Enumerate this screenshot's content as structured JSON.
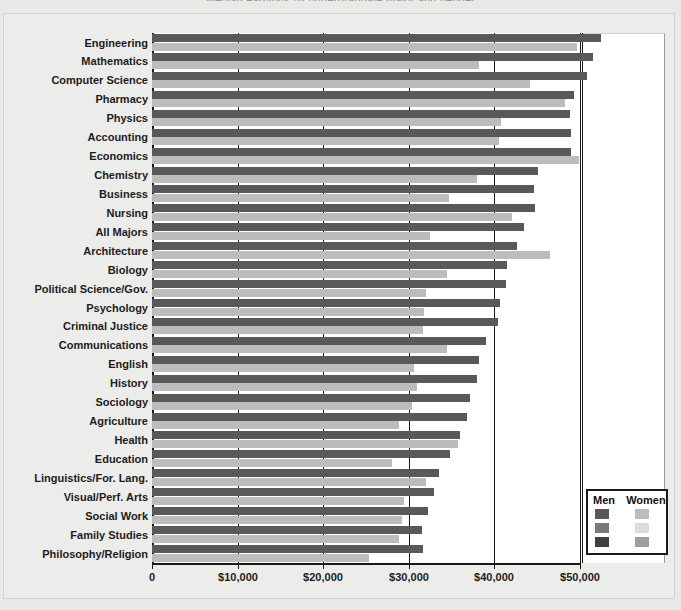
{
  "title": "Median earnings by undergraduate major and gender",
  "axis": {
    "ticks": [
      {
        "label": "0",
        "value": 0
      },
      {
        "label": "$10,000",
        "value": 10000
      },
      {
        "label": "$20,000",
        "value": 20000
      },
      {
        "label": "$30,000",
        "value": 30000
      },
      {
        "label": "$40,000",
        "value": 40000
      },
      {
        "label": "$50,000",
        "value": 50000
      }
    ],
    "min": 0,
    "max": 50000
  },
  "legend": {
    "men_header": "Men",
    "women_header": "Women",
    "swatches": [
      {
        "men": "#595959",
        "women": "#bdbdbd"
      },
      {
        "men": "#7a7a7a",
        "women": "#dcdcdc"
      },
      {
        "men": "#404040",
        "women": "#9e9e9e"
      }
    ]
  },
  "colors": {
    "men": "#595959",
    "women": "#bcbcbc",
    "plot_bg": "#ffffff",
    "page_bg": "#e9e9e7",
    "axis": "#1a1a1a"
  },
  "chart_data": {
    "type": "bar",
    "orientation": "horizontal",
    "title": "Median earnings by undergraduate major and gender",
    "xlabel": "",
    "ylabel": "",
    "xlim": [
      0,
      50000
    ],
    "grid": true,
    "legend_position": "bottom-right",
    "categories": [
      "Engineering",
      "Mathematics",
      "Computer Science",
      "Pharmacy",
      "Physics",
      "Accounting",
      "Economics",
      "Chemistry",
      "Business",
      "Nursing",
      "All Majors",
      "Architecture",
      "Biology",
      "Political Science/Gov.",
      "Psychology",
      "Criminal Justice",
      "Communications",
      "English",
      "History",
      "Sociology",
      "Agriculture",
      "Health",
      "Education",
      "Linguistics/For. Lang.",
      "Visual/Perf. Arts",
      "Social Work",
      "Family Studies",
      "Philosophy/Religion"
    ],
    "series": [
      {
        "name": "Men",
        "color": "#595959",
        "values": [
          52500,
          51500,
          50800,
          49300,
          48800,
          49000,
          48900,
          45100,
          44600,
          44800,
          43500,
          42600,
          41500,
          41300,
          40700,
          40400,
          39000,
          38200,
          38000,
          37200,
          36800,
          36000,
          34800,
          33500,
          33000,
          32200,
          31600,
          31700
        ]
      },
      {
        "name": "Women",
        "color": "#bcbcbc",
        "values": [
          49600,
          38200,
          44200,
          48300,
          40800,
          40500,
          49900,
          38000,
          34700,
          42100,
          32500,
          46500,
          34500,
          32000,
          31800,
          31700,
          34500,
          30600,
          31000,
          30400,
          28800,
          35700,
          28000,
          32000,
          29400,
          29200,
          28900,
          25400
        ]
      }
    ]
  }
}
